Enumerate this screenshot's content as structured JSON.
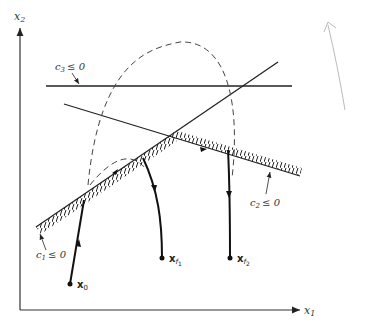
{
  "figure": {
    "axes": {
      "x_label": "x",
      "x_sub": "1",
      "y_label": "x",
      "y_sub": "2"
    },
    "constraints": [
      {
        "id": "c1",
        "label": "c",
        "sub": "1",
        "relation": "≤ 0"
      },
      {
        "id": "c2",
        "label": "c",
        "sub": "2",
        "relation": "≤ 0"
      },
      {
        "id": "c3",
        "label": "c",
        "sub": "3",
        "relation": "≤ 0"
      }
    ],
    "points": [
      {
        "id": "x0",
        "label": "x",
        "sub": "0"
      },
      {
        "id": "xf1",
        "label": "x",
        "sub": "f",
        "subsub": "1"
      },
      {
        "id": "xf2",
        "label": "x",
        "sub": "f",
        "subsub": "2"
      }
    ],
    "colors": {
      "ink": "#222222",
      "dashed": "#444444",
      "pencil": "#bbbbbb"
    }
  }
}
